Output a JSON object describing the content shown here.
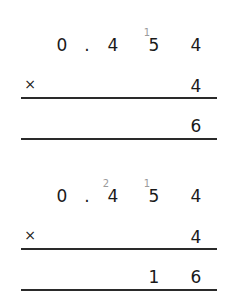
{
  "steps": [
    {
      "multiplicand": [
        "0",
        ".",
        "4",
        "5",
        "4"
      ],
      "carries": {
        "col3": "",
        "col4": "1"
      },
      "operator": "×",
      "multiplier": "4",
      "result": [
        "",
        "",
        "",
        "",
        "6"
      ]
    },
    {
      "multiplicand": [
        "0",
        ".",
        "4",
        "5",
        "4"
      ],
      "carries": {
        "col3": "2",
        "col4": "1"
      },
      "operator": "×",
      "multiplier": "4",
      "result": [
        "",
        "",
        "",
        "1",
        "6"
      ]
    }
  ],
  "colors": {
    "digit": "#1a1a1a",
    "carry": "#9a9a9a",
    "rule": "#2a2a2a"
  }
}
